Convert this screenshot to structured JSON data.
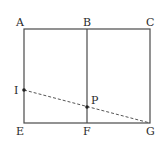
{
  "diagram": {
    "type": "geometry",
    "stroke_color": "#4a4a4a",
    "points": {
      "A": {
        "label": "A",
        "x": 24,
        "y": 29
      },
      "B": {
        "label": "B",
        "x": 87,
        "y": 29
      },
      "C": {
        "label": "C",
        "x": 150,
        "y": 29
      },
      "E": {
        "label": "E",
        "x": 24,
        "y": 123
      },
      "F": {
        "label": "F",
        "x": 87,
        "y": 123
      },
      "G": {
        "label": "G",
        "x": 150,
        "y": 123
      },
      "I": {
        "label": "I",
        "x": 24,
        "y": 90
      },
      "P": {
        "label": "P",
        "x": 87,
        "y": 107
      }
    },
    "segments": [
      {
        "from": "A",
        "to": "C",
        "style": "solid"
      },
      {
        "from": "C",
        "to": "G",
        "style": "solid"
      },
      {
        "from": "G",
        "to": "E",
        "style": "solid"
      },
      {
        "from": "E",
        "to": "A",
        "style": "solid"
      },
      {
        "from": "B",
        "to": "F",
        "style": "solid"
      },
      {
        "from": "I",
        "to": "G",
        "style": "dashed"
      }
    ],
    "marked_points": [
      "I",
      "P"
    ]
  }
}
